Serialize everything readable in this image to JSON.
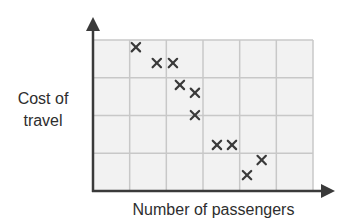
{
  "chart_data": {
    "type": "scatter",
    "title": "",
    "xlabel": "Number of passengers",
    "ylabel_lines": [
      "Cost of",
      "travel"
    ],
    "ylabel": "Cost of travel",
    "x_ticks": [],
    "y_ticks": [],
    "grid": true,
    "grid_columns": 6,
    "grid_rows": 4,
    "xlim": [
      0,
      6
    ],
    "ylim": [
      0,
      4
    ],
    "marker": "x",
    "legend": null,
    "points": [
      {
        "x": 1.17,
        "y": 3.81
      },
      {
        "x": 1.74,
        "y": 3.39
      },
      {
        "x": 2.18,
        "y": 3.39
      },
      {
        "x": 2.37,
        "y": 2.81
      },
      {
        "x": 2.78,
        "y": 2.6
      },
      {
        "x": 2.78,
        "y": 2.01
      },
      {
        "x": 3.38,
        "y": 1.22
      },
      {
        "x": 3.79,
        "y": 1.22
      },
      {
        "x": 4.6,
        "y": 0.82
      },
      {
        "x": 4.2,
        "y": 0.42
      }
    ],
    "annotations": [],
    "colors": {
      "axis": "#3a3a3a",
      "grid": "#c8c8c8",
      "plot_bg": "#f2f2f2",
      "marker": "#3a3a3a"
    }
  }
}
